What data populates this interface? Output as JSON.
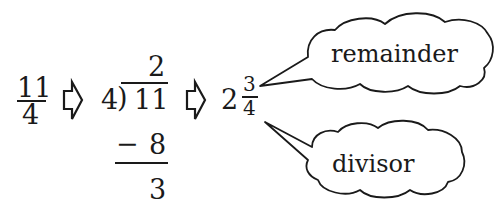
{
  "diagram": {
    "improper_fraction": {
      "numerator": "11",
      "denominator": "4"
    },
    "long_division": {
      "divisor": "4",
      "paren": ")",
      "dividend": "11",
      "quotient": "2",
      "minus": "−",
      "subtrahend": "8",
      "remainder": "3"
    },
    "mixed_number": {
      "whole": "2",
      "numerator": "3",
      "denominator": "4"
    },
    "callouts": {
      "top": "remainder",
      "bottom": "divisor"
    },
    "icons": [
      "right-arrow-icon",
      "right-arrow-icon"
    ],
    "colors": {
      "ink": "#1a1a1a",
      "background": "#ffffff"
    }
  }
}
